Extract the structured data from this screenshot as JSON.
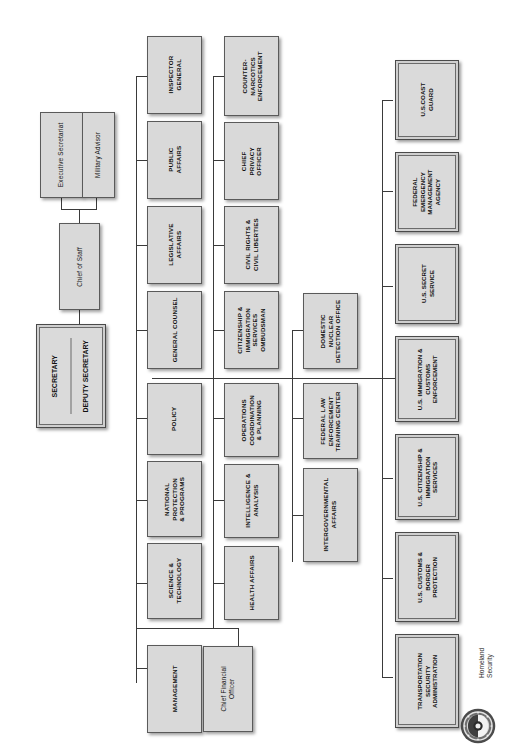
{
  "chart_title": "U.S. Department of Homeland Security Organizational Chart",
  "orientation": "rotated-90-counterclockwise",
  "colors": {
    "box_fill": "#d9d9d9",
    "box_border": "#5a5a5a",
    "line": "#3a3a3a",
    "component_frame": "#4a4a4a",
    "background": "#ffffff"
  },
  "seal": {
    "icon": "dhs-seal-icon",
    "caption_line1": "Homeland",
    "caption_line2": "Security"
  },
  "head": {
    "secretary": "SECRETARY",
    "deputy_secretary": "DEPUTY SECRETARY"
  },
  "staff": {
    "executive_secretariat": "Executive Secretariat",
    "military_advisor": "Military Advisor",
    "chief_of_staff": "Chief of Staff"
  },
  "offices_row1": [
    {
      "label": "INSPECTOR\nGENERAL",
      "name": "inspector-general"
    },
    {
      "label": "PUBLIC\nAFFAIRS",
      "name": "public-affairs"
    },
    {
      "label": "LEGISLATIVE\nAFFAIRS",
      "name": "legislative-affairs"
    },
    {
      "label": "GENERAL COUNSEL",
      "name": "general-counsel"
    },
    {
      "label": "POLICY",
      "name": "policy"
    },
    {
      "label": "NATIONAL\nPROTECTION\n& PROGRAMS",
      "name": "national-protection-and-programs"
    },
    {
      "label": "SCIENCE &\nTECHNOLOGY",
      "name": "science-and-technology"
    },
    {
      "label": "MANAGEMENT",
      "name": "management"
    }
  ],
  "offices_row2": [
    {
      "label": "COUNTER-\nNARCOTICS\nENFORCEMENT",
      "name": "counternarcotics-enforcement"
    },
    {
      "label": "CHIEF\nPRIVACY\nOFFICER",
      "name": "chief-privacy-officer"
    },
    {
      "label": "CIVIL RIGHTS &\nCIVIL LIBERTIES",
      "name": "civil-rights-and-civil-liberties"
    },
    {
      "label": "CITIZENSHIP &\nIMMIGRATION\nSERVICES\nOMBUDSMAN",
      "name": "citizenship-and-immigration-services-ombudsman"
    },
    {
      "label": "OPERATIONS\nCOORDINATION\n& PLANNING",
      "name": "operations-coordination-and-planning"
    },
    {
      "label": "INTELLIGENCE &\nANALYSIS",
      "name": "intelligence-and-analysis"
    },
    {
      "label": "HEALTH AFFAIRS",
      "name": "health-affairs"
    }
  ],
  "offices_row3": [
    {
      "label": "DOMESTIC\nNUCLEAR\nDETECTION OFFICE",
      "name": "domestic-nuclear-detection-office"
    },
    {
      "label": "FEDERAL LAW\nENFORCEMENT\nTRAINING CENTER",
      "name": "federal-law-enforcement-training-center"
    },
    {
      "label": "INTERGOVERNMENTAL\nAFFAIRS",
      "name": "intergovernmental-affairs"
    }
  ],
  "chief_financial_officer": "Chief Financial\nOfficer",
  "operating_components": [
    {
      "label": "U.S.COAST\nGUARD",
      "name": "us-coast-guard"
    },
    {
      "label": "FEDERAL\nEMERGENCY\nMANAGEMENT\nAGENCY",
      "name": "federal-emergency-management-agency"
    },
    {
      "label": "U.S. SECRET\nSERVICE",
      "name": "us-secret-service"
    },
    {
      "label": "U.S. IMMIGRATION &\nCUSTOMS\nENFORCEMENT",
      "name": "us-immigration-and-customs-enforcement"
    },
    {
      "label": "U.S. CITIZENSHIP &\nIMMIGRATION\nSERVICES",
      "name": "us-citizenship-and-immigration-services"
    },
    {
      "label": "U.S. CUSTOMS &\nBORDER\nPROTECTION",
      "name": "us-customs-and-border-protection"
    },
    {
      "label": "TRANSPORTATION\nSECURITY\nADMINISTRATION",
      "name": "transportation-security-administration"
    }
  ]
}
